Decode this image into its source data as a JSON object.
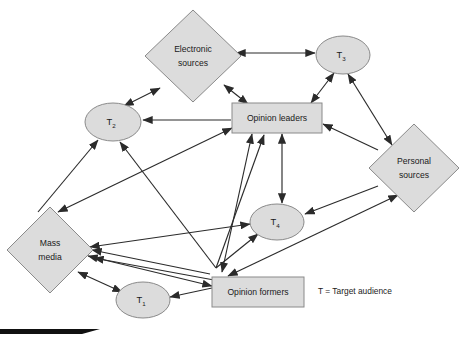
{
  "diagram": {
    "legend": {
      "text": "T = Target audience"
    },
    "colors": {
      "node_fill": "#dcdcdc",
      "node_stroke": "#8a8a8a",
      "edge": "#2b2b2b",
      "background": "#ffffff",
      "label_text": "#1a1a1a"
    },
    "nodes": [
      {
        "id": "electronic-sources",
        "label_line1": "Electronic",
        "label_line2": "sources",
        "shape": "diamond",
        "cx": 193,
        "cy": 56,
        "rx": 48,
        "ry": 46
      },
      {
        "id": "mass-media",
        "label_line1": "Mass",
        "label_line2": "media",
        "shape": "diamond",
        "cx": 50,
        "cy": 250,
        "rx": 43,
        "ry": 43
      },
      {
        "id": "personal-sources",
        "label_line1": "Personal",
        "label_line2": "sources",
        "shape": "diamond",
        "cx": 414,
        "cy": 168,
        "rx": 45,
        "ry": 44
      },
      {
        "id": "opinion-leaders",
        "label_line1": "Opinion leaders",
        "label_line2": "",
        "shape": "rect",
        "cx": 277,
        "cy": 118,
        "w": 90,
        "h": 30
      },
      {
        "id": "opinion-formers",
        "label_line1": "Opinion formers",
        "label_line2": "",
        "shape": "rect",
        "cx": 258,
        "cy": 292,
        "w": 92,
        "h": 30
      },
      {
        "id": "target-audience-1",
        "label_base": "T",
        "label_sub": "1",
        "shape": "ellipse",
        "cx": 143,
        "cy": 300,
        "rx": 27,
        "ry": 18
      },
      {
        "id": "target-audience-2",
        "label_base": "T",
        "label_sub": "2",
        "shape": "ellipse",
        "cx": 113,
        "cy": 122,
        "rx": 28,
        "ry": 19
      },
      {
        "id": "target-audience-3",
        "label_base": "T",
        "label_sub": "3",
        "shape": "ellipse",
        "cx": 343,
        "cy": 55,
        "rx": 27,
        "ry": 19
      },
      {
        "id": "target-audience-4",
        "label_base": "T",
        "label_sub": "4",
        "shape": "ellipse",
        "cx": 277,
        "cy": 222,
        "rx": 27,
        "ry": 18
      }
    ],
    "edges": [
      {
        "id": "edge-electronic-t2",
        "from": "electronic-sources",
        "to": "target-audience-2",
        "direction": "both"
      },
      {
        "id": "edge-electronic-opinion-leaders",
        "from": "electronic-sources",
        "to": "opinion-leaders",
        "direction": "both"
      },
      {
        "id": "edge-electronic-t3",
        "from": "electronic-sources",
        "to": "target-audience-3",
        "direction": "both"
      },
      {
        "id": "edge-t3-opinion-leaders",
        "from": "target-audience-3",
        "to": "opinion-leaders",
        "direction": "both"
      },
      {
        "id": "edge-t3-personal-sources",
        "from": "target-audience-3",
        "to": "personal-sources",
        "direction": "both"
      },
      {
        "id": "edge-opinion-leaders-t2",
        "from": "opinion-leaders",
        "to": "target-audience-2",
        "direction": "to-t2"
      },
      {
        "id": "edge-opinion-leaders-t4",
        "from": "opinion-leaders",
        "to": "target-audience-4",
        "direction": "both"
      },
      {
        "id": "edge-opinion-leaders-mass-media",
        "from": "opinion-leaders",
        "to": "mass-media",
        "direction": "both"
      },
      {
        "id": "edge-opinion-leaders-opinion-formers",
        "from": "opinion-leaders",
        "to": "opinion-formers",
        "direction": "both"
      },
      {
        "id": "edge-personal-sources-opinion-leaders",
        "from": "personal-sources",
        "to": "opinion-leaders",
        "direction": "to-leaders"
      },
      {
        "id": "edge-personal-sources-t4",
        "from": "personal-sources",
        "to": "target-audience-4",
        "direction": "to-t4"
      },
      {
        "id": "edge-personal-sources-opinion-formers",
        "from": "personal-sources",
        "to": "opinion-formers",
        "direction": "both"
      },
      {
        "id": "edge-mass-media-t2",
        "from": "mass-media",
        "to": "target-audience-2",
        "direction": "to-t2"
      },
      {
        "id": "edge-mass-media-t1",
        "from": "mass-media",
        "to": "target-audience-1",
        "direction": "both"
      },
      {
        "id": "edge-mass-media-opinion-formers",
        "from": "mass-media",
        "to": "opinion-formers",
        "direction": "both"
      },
      {
        "id": "edge-mass-media-t4",
        "from": "mass-media",
        "to": "target-audience-4",
        "direction": "to-t4"
      },
      {
        "id": "edge-opinion-formers-t1",
        "from": "opinion-formers",
        "to": "target-audience-1",
        "direction": "to-t1"
      },
      {
        "id": "edge-opinion-formers-t2",
        "from": "opinion-formers",
        "to": "target-audience-2",
        "direction": "to-t2"
      },
      {
        "id": "edge-opinion-formers-t4",
        "from": "opinion-formers",
        "to": "target-audience-4",
        "direction": "to-t4"
      },
      {
        "id": "edge-opinion-formers-opinion-leaders-2",
        "from": "opinion-formers",
        "to": "opinion-leaders",
        "direction": "to-leaders"
      }
    ]
  }
}
